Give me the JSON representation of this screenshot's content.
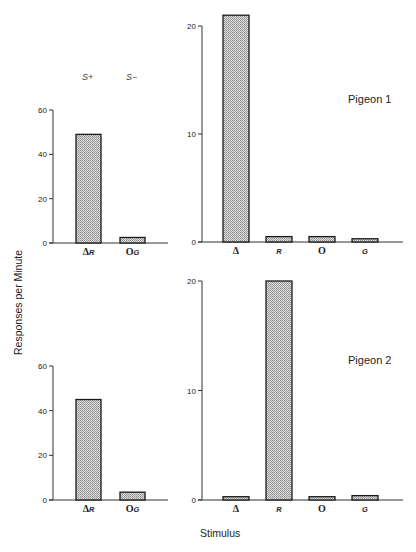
{
  "labels": {
    "y_axis_title": "Responses per Minute",
    "x_axis_title": "Stimulus",
    "s_plus": "S+",
    "s_minus": "S−",
    "pigeon1": "Pigeon 1",
    "pigeon2": "Pigeon 2"
  },
  "colors": {
    "bar_fill": "#c8c8c8",
    "bar_stroke": "#1a1a1a",
    "axis": "#333333"
  },
  "chart_data": [
    {
      "type": "bar",
      "title": "Pigeon 1 - Training",
      "categories": [
        "ΔR",
        "OG"
      ],
      "category_annotations": [
        "S+",
        "S−"
      ],
      "values": [
        49,
        2.5
      ],
      "ylabel": "Responses per Minute",
      "ylim": [
        0,
        60
      ],
      "yticks": [
        0,
        20,
        40,
        60
      ],
      "grid": false
    },
    {
      "type": "bar",
      "title": "Pigeon 1 - Test",
      "categories": [
        "Δ",
        "R",
        "O",
        "G"
      ],
      "values": [
        21,
        0.5,
        0.5,
        0.3
      ],
      "ylabel": "Responses per Minute",
      "ylim": [
        0,
        20
      ],
      "yticks": [
        0,
        10,
        20
      ],
      "annotation": "Pigeon 1",
      "grid": false
    },
    {
      "type": "bar",
      "title": "Pigeon 2 - Training",
      "categories": [
        "ΔR",
        "OG"
      ],
      "values": [
        45,
        3.5
      ],
      "ylabel": "Responses per Minute",
      "ylim": [
        0,
        60
      ],
      "yticks": [
        0,
        20,
        40,
        60
      ],
      "grid": false
    },
    {
      "type": "bar",
      "title": "Pigeon 2 - Test",
      "categories": [
        "Δ",
        "R",
        "O",
        "G"
      ],
      "values": [
        0.3,
        20,
        0.3,
        0.4
      ],
      "xlabel": "Stimulus",
      "ylabel": "Responses per Minute",
      "ylim": [
        0,
        20
      ],
      "yticks": [
        0,
        10,
        20
      ],
      "annotation": "Pigeon 2",
      "grid": false
    }
  ]
}
